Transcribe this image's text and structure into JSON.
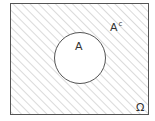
{
  "diagram": {
    "type": "venn",
    "universe": {
      "label": "Ω"
    },
    "set": {
      "label": "A"
    },
    "complement": {
      "label": "A",
      "superscript": "c"
    },
    "colors": {
      "stroke": "#555555",
      "hatch": "#b5b5b5",
      "background": "#ffffff"
    }
  }
}
